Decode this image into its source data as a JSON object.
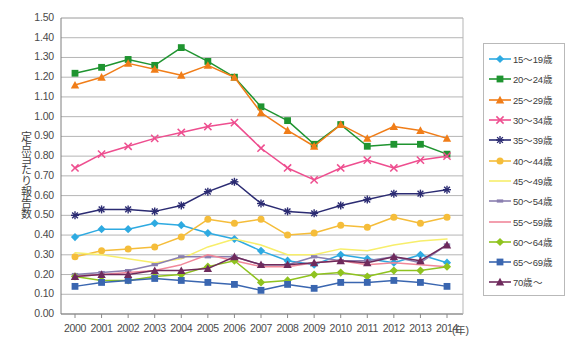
{
  "chart_data": {
    "type": "line",
    "title": "",
    "xlabel": "(年)",
    "ylabel": "定点当たり報告数",
    "ylim": [
      0.0,
      1.5
    ],
    "ytick_step": 0.1,
    "grid": true,
    "legend_position": "right",
    "categories": [
      "2000",
      "2001",
      "2002",
      "2003",
      "2004",
      "2005",
      "2006",
      "2007",
      "2008",
      "2009",
      "2010",
      "2011",
      "2012",
      "2013",
      "2014"
    ],
    "ytick_labels": [
      "0.00",
      "0.10",
      "0.20",
      "0.30",
      "0.40",
      "0.50",
      "0.60",
      "0.70",
      "0.80",
      "0.90",
      "1.00",
      "1.10",
      "1.20",
      "1.30",
      "1.40",
      "1.50"
    ],
    "series": [
      {
        "name": "15～19歳",
        "color": "#2eaae1",
        "marker": "diamond",
        "values": [
          0.39,
          0.43,
          0.43,
          0.46,
          0.45,
          0.41,
          0.38,
          0.32,
          0.27,
          0.25,
          0.3,
          0.28,
          0.26,
          0.3,
          0.26
        ]
      },
      {
        "name": "20～24歳",
        "color": "#1f9430",
        "marker": "square",
        "values": [
          1.22,
          1.25,
          1.29,
          1.26,
          1.35,
          1.28,
          1.2,
          1.05,
          0.98,
          0.86,
          0.96,
          0.85,
          0.86,
          0.86,
          0.81
        ]
      },
      {
        "name": "25～29歳",
        "color": "#f07d18",
        "marker": "triangle",
        "values": [
          1.16,
          1.2,
          1.27,
          1.24,
          1.21,
          1.26,
          1.2,
          1.02,
          0.93,
          0.85,
          0.96,
          0.89,
          0.95,
          0.93,
          0.89
        ]
      },
      {
        "name": "30～34歳",
        "color": "#ee4e8f",
        "marker": "cross",
        "values": [
          0.74,
          0.81,
          0.85,
          0.89,
          0.92,
          0.95,
          0.97,
          0.84,
          0.74,
          0.68,
          0.74,
          0.78,
          0.74,
          0.78,
          0.8
        ]
      },
      {
        "name": "35～39歳",
        "color": "#2b2b72",
        "marker": "asterisk",
        "values": [
          0.5,
          0.53,
          0.53,
          0.52,
          0.55,
          0.62,
          0.67,
          0.56,
          0.52,
          0.51,
          0.55,
          0.58,
          0.61,
          0.61,
          0.63
        ]
      },
      {
        "name": "40～44歳",
        "color": "#f5bd3a",
        "marker": "circle",
        "values": [
          0.29,
          0.32,
          0.33,
          0.34,
          0.39,
          0.48,
          0.46,
          0.48,
          0.4,
          0.41,
          0.45,
          0.44,
          0.49,
          0.46,
          0.49
        ]
      },
      {
        "name": "45～49歳",
        "color": "#f7ee6b",
        "marker": "none",
        "values": [
          0.31,
          0.3,
          0.28,
          0.26,
          0.28,
          0.34,
          0.38,
          0.35,
          0.3,
          0.3,
          0.33,
          0.32,
          0.35,
          0.37,
          0.38
        ]
      },
      {
        "name": "50～54歳",
        "color": "#8a7fb0",
        "marker": "dash",
        "values": [
          0.2,
          0.21,
          0.22,
          0.25,
          0.29,
          0.29,
          0.29,
          0.25,
          0.25,
          0.29,
          0.27,
          0.27,
          0.29,
          0.26,
          0.35
        ]
      },
      {
        "name": "55～59歳",
        "color": "#f1889a",
        "marker": "none",
        "values": [
          0.19,
          0.2,
          0.21,
          0.22,
          0.25,
          0.3,
          0.27,
          0.24,
          0.24,
          0.26,
          0.27,
          0.25,
          0.26,
          0.25,
          0.24
        ]
      },
      {
        "name": "60～64歳",
        "color": "#8fc31f",
        "marker": "diamond",
        "values": [
          0.19,
          0.17,
          0.17,
          0.19,
          0.2,
          0.24,
          0.27,
          0.16,
          0.17,
          0.2,
          0.21,
          0.19,
          0.22,
          0.22,
          0.24
        ]
      },
      {
        "name": "65～69歳",
        "color": "#3a66b0",
        "marker": "square",
        "values": [
          0.14,
          0.16,
          0.17,
          0.18,
          0.17,
          0.16,
          0.15,
          0.12,
          0.15,
          0.13,
          0.16,
          0.16,
          0.17,
          0.16,
          0.14
        ]
      },
      {
        "name": "70歳～",
        "color": "#6e2a5c",
        "marker": "triangle",
        "values": [
          0.19,
          0.2,
          0.2,
          0.22,
          0.22,
          0.23,
          0.29,
          0.25,
          0.25,
          0.26,
          0.27,
          0.26,
          0.29,
          0.27,
          0.35
        ]
      }
    ]
  }
}
